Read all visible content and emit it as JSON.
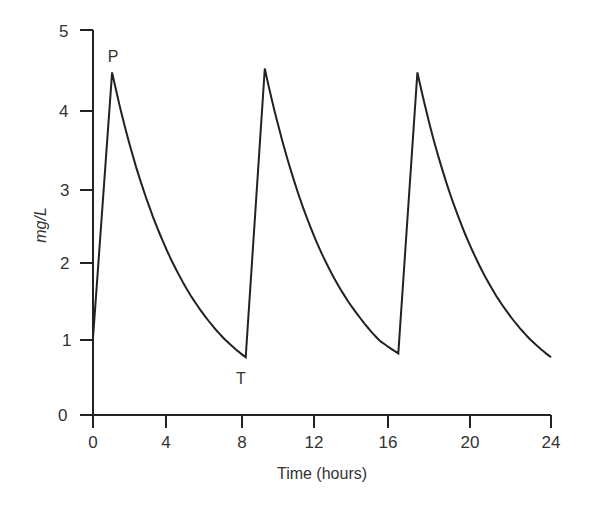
{
  "chart_data": {
    "type": "line",
    "title": "",
    "xlabel": "Time (hours)",
    "ylabel": "mg/L",
    "xlim": [
      0,
      24
    ],
    "ylim": [
      0,
      5
    ],
    "x_ticks": [
      0,
      4,
      8,
      12,
      16,
      20,
      24
    ],
    "y_ticks": [
      0,
      1,
      2,
      3,
      4,
      5
    ],
    "grid": false,
    "legend": null,
    "annotations": [
      {
        "text": "P",
        "x": 1,
        "y": 4.45,
        "meaning": "peak"
      },
      {
        "text": "T",
        "x": 8,
        "y": 0.75,
        "meaning": "trough"
      }
    ],
    "series": [
      {
        "name": "plasma concentration",
        "x": [
          0,
          1,
          2,
          3,
          4,
          5,
          6,
          7,
          8,
          9,
          10,
          11,
          12,
          13,
          14,
          15,
          16,
          17,
          18,
          19,
          20,
          21,
          22,
          23,
          24
        ],
        "y": [
          1.0,
          4.45,
          3.44,
          2.67,
          2.07,
          1.6,
          1.24,
          0.96,
          0.75,
          4.5,
          3.49,
          2.7,
          2.09,
          1.62,
          1.26,
          0.97,
          0.8,
          4.45,
          3.44,
          2.67,
          2.07,
          1.6,
          1.24,
          0.96,
          0.75
        ]
      }
    ]
  },
  "labels": {
    "x_title": "Time (hours)",
    "y_title": "mg/L",
    "peak": "P",
    "trough": "T",
    "x_ticks": [
      "0",
      "4",
      "8",
      "12",
      "16",
      "20",
      "24"
    ],
    "y_ticks": [
      "0",
      "1",
      "2",
      "3",
      "4",
      "5"
    ]
  }
}
